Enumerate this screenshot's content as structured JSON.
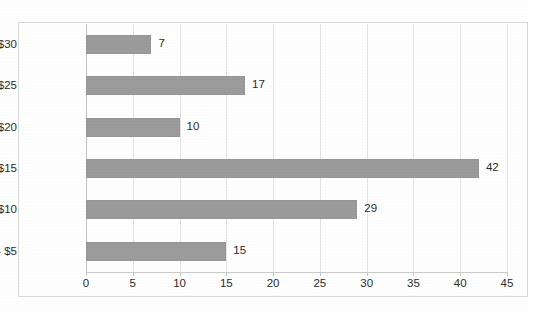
{
  "artifact": {
    "clipped_top_text": ""
  },
  "colors": {
    "bar_fill": "#9b9b9b",
    "gridline": "#e3e3e3",
    "axis_line": "#c9c9c9",
    "frame_border": "#d9d9d9",
    "text": "#2b2b2b",
    "background": "#ffffff"
  },
  "chart_data": {
    "type": "bar",
    "orientation": "horizontal",
    "title": "",
    "subtitle": "",
    "xlabel": "",
    "ylabel": "",
    "categories": [
      "$0 - $5",
      "$5 - $10",
      "$10 - $15",
      "$15 - $20",
      "$20 - $25",
      "$25 - $30"
    ],
    "values": [
      15,
      29,
      42,
      10,
      17,
      7
    ],
    "data_labels": [
      "15",
      "29",
      "42",
      "10",
      "17",
      "7"
    ],
    "xlim": [
      0,
      45
    ],
    "xticks": [
      0,
      5,
      10,
      15,
      20,
      25,
      30,
      35,
      40,
      45
    ],
    "xtick_labels": [
      "0",
      "5",
      "10",
      "15",
      "20",
      "25",
      "30",
      "35",
      "40",
      "45"
    ],
    "grid": "vertical",
    "legend": "none",
    "series": [
      {
        "name": "Count",
        "values": [
          15,
          29,
          42,
          10,
          17,
          7
        ]
      }
    ],
    "category_order_top_to_bottom": [
      "$25 - $30",
      "$20 - $25",
      "$15 - $20",
      "$10 - $15",
      "$5 - $10",
      "$0 - $5"
    ]
  }
}
